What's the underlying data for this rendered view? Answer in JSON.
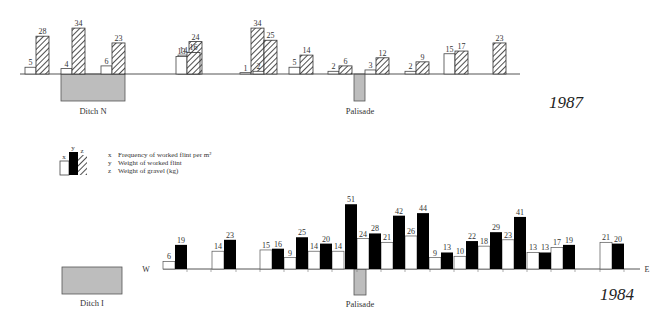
{
  "chart_data": [
    {
      "type": "bar",
      "title": "1987",
      "xlabel": "",
      "ylabel": "",
      "legend": [
        "x Frequency of worked flint per m²",
        "z Weight of gravel (kg)"
      ],
      "series": [
        {
          "name": "x",
          "label": "Frequency of worked flint per m²",
          "style": "white",
          "values": [
            5,
            4,
            6,
            14,
            13,
            1,
            2,
            5,
            2,
            3,
            2,
            15,
            null
          ]
        },
        {
          "name": "z",
          "label": "Weight of gravel (kg)",
          "style": "hatched",
          "values": [
            28,
            34,
            23,
            24,
            16,
            34,
            25,
            14,
            6,
            12,
            9,
            17,
            23
          ]
        }
      ],
      "groups_x": [
        32,
        70,
        108,
        185,
        184,
        257,
        260,
        295,
        333,
        371,
        411,
        449,
        487
      ],
      "features": [
        {
          "name": "Ditch N",
          "x0": 61,
          "x1": 125,
          "depth": 27
        },
        {
          "name": "Palisade",
          "x0": 354,
          "x1": 365,
          "depth": 27
        }
      ],
      "baseline_y": 74,
      "baseline_x": [
        20,
        520
      ]
    },
    {
      "type": "bar",
      "title": "1984",
      "xlabel": "W — E",
      "ylabel": "",
      "legend": [
        "x Frequency of worked flint per m²",
        "y Weight of worked flint"
      ],
      "series": [
        {
          "name": "x",
          "label": "Frequency of worked flint per m²",
          "style": "white",
          "values": [
            6,
            14,
            15,
            9,
            14,
            14,
            24,
            21,
            26,
            9,
            10,
            18,
            23,
            13,
            17,
            21
          ]
        },
        {
          "name": "y",
          "label": "Weight of worked flint",
          "style": "black",
          "values": [
            19,
            23,
            16,
            25,
            20,
            51,
            28,
            42,
            44,
            13,
            22,
            29,
            41,
            13,
            19,
            20
          ]
        }
      ],
      "features": [
        {
          "name": "Ditch I",
          "x0": 62,
          "x1": 122
        },
        {
          "name": "Palisade",
          "x0": 354,
          "x1": 366,
          "depth": 27
        }
      ],
      "baseline_y": 269
    }
  ],
  "labels": {
    "year_1987": "1987",
    "year_1984": "1984",
    "ditch_n": "Ditch N",
    "ditch_i": "Ditch I",
    "palisade_top": "Palisade",
    "palisade_bottom": "Palisade",
    "west": "W",
    "east": "E"
  },
  "legend": {
    "x_key": "x",
    "y_key": "y",
    "z_key": "z",
    "items": [
      {
        "key": "x",
        "text": "Frequency of worked flint per m²"
      },
      {
        "key": "y",
        "text": "Weight of worked flint"
      },
      {
        "key": "z",
        "text": "Weight of gravel (kg)"
      }
    ]
  },
  "colors": {
    "hatch": "#333333",
    "black_bar": "#000000",
    "feature_fill": "#bdbdbd",
    "axis": "#555555"
  }
}
